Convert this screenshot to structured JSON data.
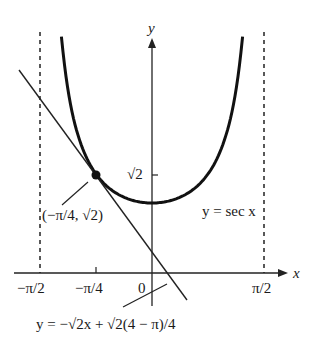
{
  "chart_data": {
    "type": "line",
    "title": "",
    "xlabel": "x",
    "ylabel": "y",
    "x_ticks": [
      "−π/2",
      "−π/4",
      "0",
      "π/2"
    ],
    "y_ticks": [
      "√2"
    ],
    "xlim": [
      -1.7,
      1.95
    ],
    "ylim": [
      -0.4,
      3.5
    ],
    "grid": false,
    "legend": null,
    "series": [
      {
        "name": "y = sec x",
        "kind": "curve",
        "function": "sec(x)",
        "domain": [
          -1.27,
          1.27
        ],
        "style": "thick solid"
      },
      {
        "name": "y = −√2x + √2(4 − π)/4",
        "kind": "tangent line",
        "slope": -1.414,
        "intercept": 0.3035,
        "style": "thin solid"
      },
      {
        "name": "asymptote x = −π/2",
        "kind": "vertical",
        "x": -1.5708,
        "style": "dashed"
      },
      {
        "name": "asymptote x = π/2",
        "kind": "vertical",
        "x": 1.5708,
        "style": "dashed"
      }
    ],
    "points": [
      {
        "x": -0.7854,
        "y": 1.4142,
        "label": "(−π/4, √2)"
      }
    ],
    "annotations": [
      {
        "text": "y = sec x",
        "target": "curve"
      },
      {
        "text": "(−π/4, √2)",
        "target": "tangent point"
      },
      {
        "text": "y = −√2x + √2(4 − π)/4",
        "target": "tangent line"
      }
    ]
  },
  "labels": {
    "x_axis": "x",
    "y_axis": "y",
    "tick_neg_pi_2": "−π/2",
    "tick_neg_pi_4": "−π/4",
    "tick_zero": "0",
    "tick_pi_2": "π/2",
    "tick_sqrt2": "√2",
    "curve_label": "y = sec x",
    "point_label": "(−π/4, √2)",
    "tangent_label": "y = −√2x + √2(4 − π)/4"
  }
}
